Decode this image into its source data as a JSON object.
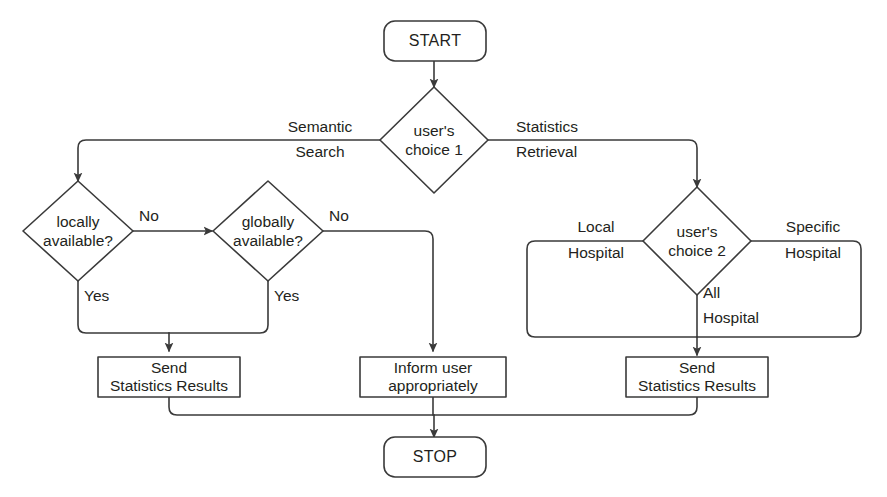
{
  "diagram": {
    "background_color": "#ffffff",
    "line_color": "#3a3a3a",
    "text_color": "#231f20"
  },
  "nodes": {
    "start": {
      "label": "START",
      "shape": "rounded-rectangle"
    },
    "choice1": {
      "label_line1": "user's",
      "label_line2": "choice 1",
      "shape": "diamond"
    },
    "locally_available": {
      "label_line1": "locally",
      "label_line2": "available?",
      "shape": "diamond"
    },
    "globally_available": {
      "label_line1": "globally",
      "label_line2": "available?",
      "shape": "diamond"
    },
    "choice2": {
      "label_line1": "user's",
      "label_line2": "choice 2",
      "shape": "diamond"
    },
    "send_left": {
      "label_line1": "Send",
      "label_line2": "Statistics Results",
      "shape": "rectangle"
    },
    "inform_user": {
      "label_line1": "Inform user",
      "label_line2": "appropriately",
      "shape": "rectangle"
    },
    "send_right": {
      "label_line1": "Send",
      "label_line2": "Statistics Results",
      "shape": "rectangle"
    },
    "stop": {
      "label": "STOP",
      "shape": "rounded-rectangle"
    }
  },
  "edge_labels": {
    "semantic_search_line1": "Semantic",
    "semantic_search_line2": "Search",
    "statistics_retrieval_line1": "Statistics",
    "statistics_retrieval_line2": "Retrieval",
    "locally_no": "No",
    "locally_yes": "Yes",
    "globally_no": "No",
    "globally_yes": "Yes",
    "local_hospital_line1": "Local",
    "local_hospital_line2": "Hospital",
    "specific_hospital_line1": "Specific",
    "specific_hospital_line2": "Hospital",
    "all_hospital_line1": "All",
    "all_hospital_line2": "Hospital"
  }
}
